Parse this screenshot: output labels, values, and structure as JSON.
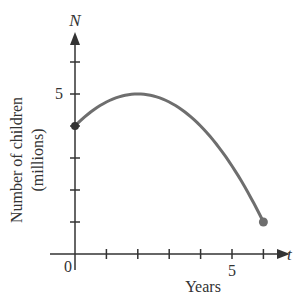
{
  "chart_data": {
    "type": "line",
    "title": "",
    "xlabel": "Years",
    "ylabel": "Number of children (millions)",
    "ylabel_line1": "Number of children",
    "ylabel_line2": "(millions)",
    "x_axis_var": "t",
    "y_axis_var": "N",
    "origin_label": "0",
    "x_tick_labels": [
      {
        "value": 5,
        "label": "5"
      }
    ],
    "y_tick_labels": [
      {
        "value": 5,
        "label": "5"
      }
    ],
    "x_ticks": [
      1,
      2,
      3,
      4,
      5,
      6
    ],
    "y_ticks": [
      1,
      2,
      3,
      4,
      5,
      6
    ],
    "xlim": [
      0,
      6.5
    ],
    "ylim": [
      0,
      6.5
    ],
    "grid": false,
    "series": [
      {
        "name": "N(t)",
        "formula": "N = -0.25 t^2 + t + 4",
        "x": [
          0,
          1,
          2,
          3,
          4,
          5,
          6
        ],
        "values": [
          4,
          4.75,
          5,
          4.75,
          4,
          2.75,
          1
        ],
        "endpoints": [
          {
            "t": 0,
            "N": 4,
            "marker": "filled-dot"
          },
          {
            "t": 6,
            "N": 1,
            "marker": "filled-dot"
          }
        ]
      }
    ],
    "colors": {
      "curve": "#6e6e6e",
      "axes": "#333333"
    }
  }
}
